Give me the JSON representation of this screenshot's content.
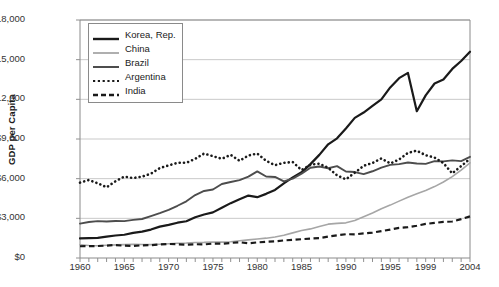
{
  "chart_data": {
    "type": "line",
    "title": "",
    "xlabel": "",
    "ylabel": "GDP per Capita",
    "xlim": [
      1960,
      2004
    ],
    "ylim": [
      0,
      18000
    ],
    "grid": true,
    "legend_position": "top-left",
    "y_ticks": [
      "$0",
      "$3,000",
      "$6,000",
      "$9,000",
      "$12,000",
      "$15,000",
      "$18,000"
    ],
    "y_tick_values": [
      0,
      3000,
      6000,
      9000,
      12000,
      15000,
      18000
    ],
    "x_ticks": [
      "1960",
      "1965",
      "1970",
      "1975",
      "1980",
      "1985",
      "1990",
      "1995",
      "1999",
      "2004"
    ],
    "x_tick_values": [
      1960,
      1965,
      1970,
      1975,
      1980,
      1985,
      1990,
      1995,
      1999,
      2004
    ],
    "x": [
      1960,
      1961,
      1962,
      1963,
      1964,
      1965,
      1966,
      1967,
      1968,
      1969,
      1970,
      1971,
      1972,
      1973,
      1974,
      1975,
      1976,
      1977,
      1978,
      1979,
      1980,
      1981,
      1982,
      1983,
      1984,
      1985,
      1986,
      1987,
      1988,
      1989,
      1990,
      1991,
      1992,
      1993,
      1994,
      1995,
      1996,
      1997,
      1998,
      1999,
      2000,
      2001,
      2002,
      2003,
      2004
    ],
    "series": [
      {
        "name": "Korea, Rep.",
        "style": "solid",
        "color": "#1a1a1a",
        "width": 2.2,
        "values": [
          1480,
          1500,
          1520,
          1620,
          1700,
          1760,
          1900,
          1990,
          2150,
          2370,
          2500,
          2670,
          2780,
          3080,
          3290,
          3450,
          3800,
          4150,
          4450,
          4720,
          4600,
          4850,
          5150,
          5650,
          6100,
          6480,
          7100,
          7800,
          8600,
          9050,
          9800,
          10600,
          11000,
          11500,
          12000,
          12900,
          13600,
          14000,
          11100,
          12300,
          13200,
          13500,
          14300,
          14900,
          15600
        ]
      },
      {
        "name": "China",
        "style": "solid",
        "color": "#a6a6a6",
        "width": 1.6,
        "values": [
          1000,
          950,
          930,
          960,
          990,
          1010,
          1030,
          1020,
          1010,
          1040,
          1080,
          1110,
          1130,
          1170,
          1180,
          1210,
          1200,
          1230,
          1300,
          1370,
          1440,
          1500,
          1590,
          1720,
          1900,
          2080,
          2200,
          2380,
          2560,
          2620,
          2660,
          2840,
          3120,
          3400,
          3720,
          4000,
          4300,
          4600,
          4850,
          5100,
          5400,
          5750,
          6150,
          6650,
          7200
        ]
      },
      {
        "name": "Brazil",
        "style": "solid",
        "color": "#4d4d4d",
        "width": 1.9,
        "values": [
          2600,
          2720,
          2790,
          2760,
          2800,
          2790,
          2880,
          2950,
          3170,
          3390,
          3640,
          3950,
          4290,
          4760,
          5070,
          5180,
          5600,
          5750,
          5890,
          6150,
          6550,
          6160,
          6130,
          5790,
          6000,
          6380,
          6830,
          6920,
          6790,
          6950,
          6540,
          6500,
          6340,
          6560,
          6840,
          7040,
          7100,
          7220,
          7150,
          7120,
          7330,
          7310,
          7380,
          7330,
          7650
        ]
      },
      {
        "name": "Argentina",
        "style": "dotted",
        "color": "#1a1a1a",
        "width": 2.0,
        "values": [
          5700,
          5900,
          5650,
          5350,
          5800,
          6150,
          6050,
          6150,
          6380,
          6800,
          7000,
          7200,
          7200,
          7500,
          7900,
          7700,
          7500,
          7800,
          7350,
          7750,
          7900,
          7350,
          7020,
          7200,
          7260,
          6650,
          7050,
          7140,
          6820,
          6250,
          5950,
          6450,
          6970,
          7190,
          7530,
          7150,
          7450,
          7950,
          8120,
          7770,
          7600,
          7180,
          6400,
          6950,
          7500
        ]
      },
      {
        "name": "India",
        "style": "dashed",
        "color": "#1a1a1a",
        "width": 2.2,
        "values": [
          890,
          900,
          905,
          940,
          980,
          930,
          910,
          960,
          970,
          1020,
          1060,
          1040,
          1010,
          1040,
          1030,
          1090,
          1080,
          1140,
          1190,
          1110,
          1180,
          1230,
          1260,
          1330,
          1370,
          1420,
          1470,
          1500,
          1620,
          1710,
          1800,
          1790,
          1860,
          1920,
          2030,
          2150,
          2280,
          2330,
          2440,
          2580,
          2650,
          2730,
          2760,
          2940,
          3150
        ]
      }
    ]
  },
  "legend": {
    "items": [
      {
        "label": "Korea, Rep."
      },
      {
        "label": "China"
      },
      {
        "label": "Brazil"
      },
      {
        "label": "Argentina"
      },
      {
        "label": "India"
      }
    ]
  },
  "colors": {
    "korea": "#1a1a1a",
    "china": "#a6a6a6",
    "brazil": "#4d4d4d",
    "argentina": "#1a1a1a",
    "india": "#1a1a1a",
    "grid": "#c9c9c9",
    "axis": "#8a8a8a",
    "text": "#1a1a1a"
  }
}
